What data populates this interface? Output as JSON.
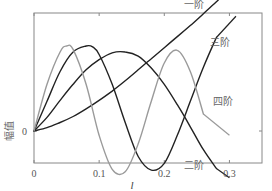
{
  "chart_data": {
    "type": "line",
    "title": "",
    "xlabel": "l",
    "ylabel": "幅值",
    "xlim": [
      0,
      0.35
    ],
    "ylim": [
      -0.55,
      1.9
    ],
    "xticks": [
      0,
      0.1,
      0.2,
      0.3
    ],
    "xtick_labels": [
      "0",
      "0.1",
      "0.2",
      "0.3"
    ],
    "yticks": [
      0
    ],
    "ytick_labels": [
      "0"
    ],
    "grid": false,
    "legend": "inline labels",
    "series": [
      {
        "name": "一阶",
        "color": "#222222",
        "x": [
          0,
          0.02,
          0.04,
          0.06,
          0.08,
          0.1,
          0.12,
          0.14,
          0.16,
          0.18,
          0.2,
          0.22,
          0.24,
          0.26,
          0.28,
          0.29
        ],
        "y": [
          0,
          0.04,
          0.1,
          0.17,
          0.26,
          0.36,
          0.47,
          0.59,
          0.72,
          0.85,
          0.98,
          1.11,
          1.24,
          1.38,
          1.52,
          1.6
        ],
        "label_at": [
          0.245,
          1.5
        ],
        "leader": [
          [
            0.255,
            1.55
          ],
          [
            0.29,
            1.72
          ]
        ]
      },
      {
        "name": "二阶",
        "color": "#222222",
        "x": [
          0,
          0.02,
          0.04,
          0.06,
          0.08,
          0.1,
          0.12,
          0.14,
          0.16,
          0.18,
          0.2,
          0.22,
          0.24,
          0.26,
          0.28
        ],
        "y": [
          0,
          0.16,
          0.36,
          0.55,
          0.72,
          0.84,
          0.92,
          0.93,
          0.88,
          0.74,
          0.55,
          0.31,
          0.05,
          -0.22,
          -0.44
        ],
        "label_at": [
          0.245,
          -0.4
        ],
        "leader": [
          [
            0.28,
            -0.44
          ],
          [
            0.3,
            -0.55
          ]
        ]
      },
      {
        "name": "三阶",
        "color": "#222222",
        "x": [
          0,
          0.02,
          0.04,
          0.06,
          0.08,
          0.09,
          0.1,
          0.12,
          0.14,
          0.16,
          0.18,
          0.2,
          0.22,
          0.24,
          0.26,
          0.28
        ],
        "y": [
          0,
          0.35,
          0.7,
          0.93,
          1.0,
          0.99,
          0.9,
          0.55,
          0.1,
          -0.3,
          -0.46,
          -0.38,
          -0.05,
          0.35,
          0.75,
          1.1
        ],
        "label_at": [
          0.285,
          1.05
        ],
        "leader": [
          [
            0.28,
            1.1
          ],
          [
            0.31,
            1.35
          ]
        ]
      },
      {
        "name": "四阶",
        "color": "#9a9a9a",
        "x": [
          0,
          0.02,
          0.04,
          0.05,
          0.06,
          0.08,
          0.1,
          0.12,
          0.14,
          0.16,
          0.18,
          0.2,
          0.22,
          0.24,
          0.26
        ],
        "y": [
          0,
          0.55,
          0.93,
          1.0,
          0.96,
          0.55,
          -0.05,
          -0.45,
          -0.48,
          -0.15,
          0.35,
          0.8,
          0.95,
          0.7,
          0.2
        ],
        "label_at": [
          0.29,
          0.35
        ],
        "leader": [
          [
            0.26,
            0.2
          ],
          [
            0.3,
            -0.05
          ]
        ]
      }
    ]
  }
}
